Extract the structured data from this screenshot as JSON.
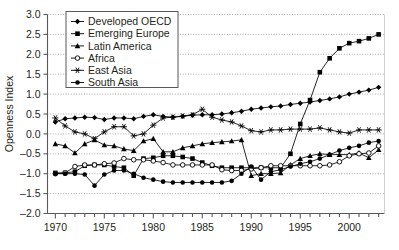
{
  "chart_data": {
    "type": "line",
    "title": "",
    "subtitle": "",
    "xlabel": "",
    "ylabel": "Openness Index",
    "xlim": [
      1969.2,
      2003.6
    ],
    "ylim": [
      -2.0,
      3.0
    ],
    "grid": true,
    "grid_axis": "y",
    "legend_position": "top-left",
    "y_ticks": [
      -2.0,
      -1.5,
      -1.0,
      -0.5,
      0.0,
      0.5,
      1.0,
      1.5,
      2.0,
      2.5,
      3.0
    ],
    "y_tick_labels": [
      "-2.0",
      "-1.5",
      "-1.0",
      "-0.5",
      "0.0",
      "0.5",
      "1.0",
      "1.5",
      "2.0",
      "2.5",
      "3.0"
    ],
    "x_ticks": [
      1970,
      1971,
      1972,
      1973,
      1974,
      1975,
      1976,
      1977,
      1978,
      1979,
      1980,
      1981,
      1982,
      1983,
      1984,
      1985,
      1986,
      1987,
      1988,
      1989,
      1990,
      1991,
      1992,
      1993,
      1994,
      1995,
      1996,
      1997,
      1998,
      1999,
      2000,
      2001,
      2002,
      2003
    ],
    "x_tick_labels_major": [
      "1970",
      "1975",
      "1980",
      "1985",
      "1990",
      "1995",
      "2000"
    ],
    "x_major_values": [
      1970,
      1975,
      1980,
      1985,
      1990,
      1995,
      2000
    ],
    "x": [
      1970,
      1971,
      1972,
      1973,
      1974,
      1975,
      1976,
      1977,
      1978,
      1979,
      1980,
      1981,
      1982,
      1983,
      1984,
      1985,
      1986,
      1987,
      1988,
      1989,
      1990,
      1991,
      1992,
      1993,
      1994,
      1995,
      1996,
      1997,
      1998,
      1999,
      2000,
      2001,
      2002,
      2003
    ],
    "series": [
      {
        "name": "Developed OECD",
        "marker": "diamond",
        "color": "#000000",
        "values": [
          0.3,
          0.38,
          0.4,
          0.42,
          0.41,
          0.36,
          0.4,
          0.4,
          0.38,
          0.44,
          0.48,
          0.44,
          0.42,
          0.44,
          0.47,
          0.48,
          0.48,
          0.5,
          0.53,
          0.57,
          0.62,
          0.65,
          0.68,
          0.7,
          0.74,
          0.77,
          0.8,
          0.84,
          0.88,
          0.93,
          1.0,
          1.05,
          1.1,
          1.17
        ]
      },
      {
        "name": "Emerging Europe",
        "marker": "square",
        "color": "#000000",
        "values": [
          -0.98,
          -0.98,
          -0.95,
          -0.8,
          -0.78,
          -0.78,
          -0.82,
          -0.85,
          -1.05,
          -0.62,
          -0.6,
          -0.55,
          -0.55,
          -0.58,
          -0.62,
          -0.72,
          -0.8,
          -0.85,
          -0.85,
          -0.85,
          -0.85,
          -0.85,
          -0.85,
          -0.85,
          -0.5,
          0.25,
          0.85,
          1.55,
          1.9,
          2.15,
          2.28,
          2.33,
          2.4,
          2.5
        ]
      },
      {
        "name": "Latin America",
        "marker": "triangle",
        "color": "#000000",
        "values": [
          -0.25,
          -0.3,
          -0.48,
          -0.25,
          -0.15,
          -0.28,
          -0.3,
          -0.38,
          -0.42,
          -0.18,
          -0.12,
          -0.45,
          -0.45,
          -0.35,
          -0.3,
          -0.25,
          -0.22,
          -0.2,
          -0.18,
          -0.15,
          -1.05,
          -1.0,
          -1.0,
          -0.98,
          -0.78,
          -0.62,
          -0.55,
          -0.5,
          -0.52,
          -0.52,
          -0.52,
          -0.48,
          -0.6,
          -0.4
        ]
      },
      {
        "name": "Africa",
        "marker": "circle-open",
        "color": "#000000",
        "values": [
          -1.0,
          -0.98,
          -0.82,
          -0.78,
          -0.78,
          -0.75,
          -0.73,
          -0.62,
          -0.65,
          -0.65,
          -0.68,
          -0.72,
          -0.78,
          -0.78,
          -0.78,
          -0.78,
          -0.78,
          -0.9,
          -0.92,
          -0.92,
          -0.88,
          -0.85,
          -0.8,
          -0.8,
          -0.8,
          -0.8,
          -0.8,
          -0.8,
          -0.78,
          -0.7,
          -0.55,
          -0.5,
          -0.48,
          -0.3
        ]
      },
      {
        "name": "East Asia",
        "marker": "star",
        "color": "#000000",
        "values": [
          0.4,
          0.2,
          0.05,
          0.0,
          -0.12,
          0.05,
          0.18,
          0.18,
          -0.05,
          0.0,
          0.22,
          0.4,
          0.42,
          0.45,
          0.48,
          0.62,
          0.42,
          0.35,
          0.3,
          0.2,
          0.08,
          0.05,
          0.1,
          0.1,
          0.12,
          0.12,
          0.12,
          0.15,
          0.1,
          0.05,
          0.02,
          0.1,
          0.1,
          0.1
        ]
      },
      {
        "name": "South Asia",
        "marker": "circle-filled",
        "color": "#000000",
        "values": [
          -1.0,
          -1.0,
          -1.0,
          -1.02,
          -1.3,
          -1.02,
          -0.92,
          -0.92,
          -1.0,
          -1.1,
          -1.15,
          -1.2,
          -1.22,
          -1.22,
          -1.22,
          -1.22,
          -1.22,
          -1.22,
          -1.18,
          -1.0,
          -0.82,
          -1.15,
          -0.95,
          -0.9,
          -0.82,
          -0.75,
          -0.7,
          -0.62,
          -0.52,
          -0.42,
          -0.35,
          -0.3,
          -0.22,
          -0.18
        ]
      }
    ]
  },
  "legend": {
    "items": [
      {
        "label": "Developed OECD",
        "marker": "diamond"
      },
      {
        "label": "Emerging Europe",
        "marker": "square"
      },
      {
        "label": "Latin America",
        "marker": "triangle"
      },
      {
        "label": "Africa",
        "marker": "circle-open"
      },
      {
        "label": "East Asia",
        "marker": "star"
      },
      {
        "label": "South Asia",
        "marker": "circle-filled"
      }
    ]
  },
  "axes": {
    "y_title": "Openness Index"
  }
}
